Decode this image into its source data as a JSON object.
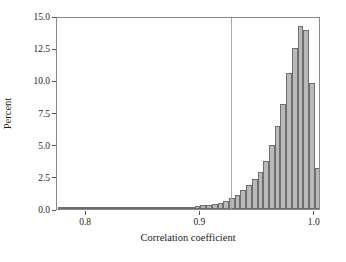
{
  "chart_data": {
    "type": "bar",
    "title": "",
    "subtitle": "",
    "xlabel": "Correlation coefficient",
    "ylabel": "Percent",
    "xlim": [
      0.7745,
      1.0055
    ],
    "ylim": [
      0.0,
      15.0
    ],
    "grid": false,
    "legend": null,
    "bin_width": 0.005,
    "xticks": [
      {
        "value": 0.8,
        "label": "0.8"
      },
      {
        "value": 0.9,
        "label": "0.9"
      },
      {
        "value": 1.0,
        "label": "1.0"
      }
    ],
    "yticks": [
      {
        "value": 0.0,
        "label": "0.0"
      },
      {
        "value": 2.5,
        "label": "2.5"
      },
      {
        "value": 5.0,
        "label": "5.0"
      },
      {
        "value": 7.5,
        "label": "7.5"
      },
      {
        "value": 10.0,
        "label": "10.0"
      },
      {
        "value": 12.5,
        "label": "12.5"
      },
      {
        "value": 15.0,
        "label": "15.0"
      }
    ],
    "annotations": [
      {
        "name": "vertical-reference-line",
        "type": "vline",
        "x": 0.927,
        "color": "#a9a9a9"
      }
    ],
    "colors": {
      "bar_fill": "#b9b9b9",
      "bar_stroke": "#6e6e6e",
      "axis": "#8a8a8a",
      "text": "#1c1c1c",
      "reference_line": "#a9a9a9",
      "background": "#ffffff"
    },
    "x": [
      0.7775,
      0.7825,
      0.7875,
      0.7925,
      0.7975,
      0.8025,
      0.8075,
      0.8125,
      0.8175,
      0.8225,
      0.8275,
      0.8325,
      0.8375,
      0.8425,
      0.8475,
      0.8525,
      0.8575,
      0.8625,
      0.8675,
      0.8725,
      0.8775,
      0.8825,
      0.8875,
      0.8925,
      0.8975,
      0.9025,
      0.9075,
      0.9125,
      0.9175,
      0.9225,
      0.9275,
      0.9325,
      0.9375,
      0.9425,
      0.9475,
      0.9525,
      0.9575,
      0.9625,
      0.9675,
      0.9725,
      0.9775,
      0.9825,
      0.9875,
      0.9925,
      0.9975
    ],
    "values": [
      0.02,
      0.02,
      0.02,
      0.02,
      0.02,
      0.03,
      0.03,
      0.03,
      0.03,
      0.04,
      0.04,
      0.04,
      0.05,
      0.05,
      0.05,
      0.06,
      0.06,
      0.07,
      0.08,
      0.09,
      0.1,
      0.12,
      0.15,
      0.18,
      0.22,
      0.28,
      0.33,
      0.4,
      0.5,
      0.65,
      0.85,
      1.1,
      1.45,
      1.85,
      2.3,
      2.85,
      3.75,
      5.0,
      6.45,
      8.15,
      10.55,
      12.5,
      14.2,
      13.9,
      9.8
    ],
    "extra_values": [
      3.15,
      0.1
    ],
    "categories": [
      "0.7775",
      "0.7825",
      "0.7875",
      "0.7925",
      "0.7975",
      "0.8025",
      "0.8075",
      "0.8125",
      "0.8175",
      "0.8225",
      "0.8275",
      "0.8325",
      "0.8375",
      "0.8425",
      "0.8475",
      "0.8525",
      "0.8575",
      "0.8625",
      "0.8675",
      "0.8725",
      "0.8775",
      "0.8825",
      "0.8875",
      "0.8925",
      "0.8975",
      "0.9025",
      "0.9075",
      "0.9125",
      "0.9175",
      "0.9225",
      "0.9275",
      "0.9325",
      "0.9375",
      "0.9425",
      "0.9475",
      "0.9525",
      "0.9575",
      "0.9625",
      "0.9675",
      "0.9725",
      "0.9775",
      "0.9825",
      "0.9875",
      "0.9925",
      "0.9975"
    ]
  }
}
